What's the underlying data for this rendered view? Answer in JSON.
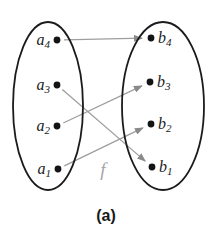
{
  "caption": "(a)",
  "function_label": "f",
  "colors": {
    "background": "#ffffff",
    "outline": "#1b1b1b",
    "dot": "#141414",
    "arrow_line": "#9e9e9e",
    "arrow_head": "#8a8a8a",
    "element_label": "#1b1b1b",
    "function_label": "#a6a6a6",
    "caption": "#1a1a1a"
  },
  "diagram": {
    "width": 212,
    "height": 239,
    "left_set": {
      "ellipse": {
        "cx": 48,
        "cy": 106,
        "rx": 35,
        "ry": 84
      },
      "label_side": "left",
      "elements": [
        {
          "name": "a4",
          "base": "a",
          "sub": "4",
          "dot": {
            "x": 57,
            "y": 40
          }
        },
        {
          "name": "a3",
          "base": "a",
          "sub": "3",
          "dot": {
            "x": 57,
            "y": 85
          }
        },
        {
          "name": "a2",
          "base": "a",
          "sub": "2",
          "dot": {
            "x": 57,
            "y": 126
          }
        },
        {
          "name": "a1",
          "base": "a",
          "sub": "1",
          "dot": {
            "x": 58,
            "y": 169
          }
        }
      ]
    },
    "right_set": {
      "ellipse": {
        "cx": 163,
        "cy": 106,
        "rx": 41,
        "ry": 84
      },
      "label_side": "right",
      "elements": [
        {
          "name": "b4",
          "base": "b",
          "sub": "4",
          "dot": {
            "x": 151,
            "y": 38
          }
        },
        {
          "name": "b3",
          "base": "b",
          "sub": "3",
          "dot": {
            "x": 150,
            "y": 82
          }
        },
        {
          "name": "b2",
          "base": "b",
          "sub": "2",
          "dot": {
            "x": 151,
            "y": 124
          }
        },
        {
          "name": "b1",
          "base": "b",
          "sub": "1",
          "dot": {
            "x": 152,
            "y": 167
          }
        }
      ]
    },
    "mappings": [
      {
        "from": "a4",
        "to": "b4"
      },
      {
        "from": "a3",
        "to": "b1"
      },
      {
        "from": "a2",
        "to": "b3"
      },
      {
        "from": "a1",
        "to": "b2"
      }
    ],
    "function_label_pos": {
      "x": 103,
      "y": 176
    },
    "caption_pos": {
      "x": 106,
      "y": 221
    }
  }
}
